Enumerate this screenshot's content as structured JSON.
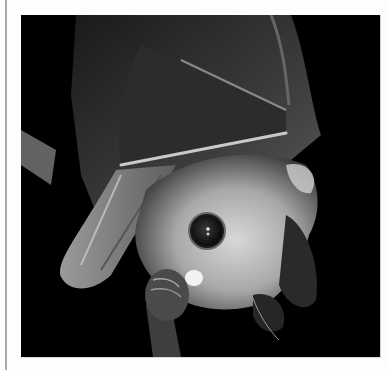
{
  "image": {
    "subject": "Fruit bat hanging upside down, wings folded, large dark eye",
    "alt": "Black and white close-up photograph of a fruit bat hanging upside down",
    "style": "monochrome",
    "colors": {
      "background": "#000000",
      "fur": "#b8b8b8",
      "wing": "#3a3a3a",
      "page": "#fdfdfd",
      "margin_line": "#a9a9a9"
    }
  }
}
